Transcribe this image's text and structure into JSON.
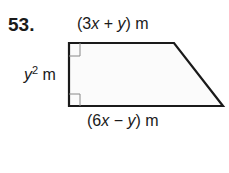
{
  "problem_number": "53.",
  "labels": {
    "top": {
      "pre": "(3",
      "v1": "x",
      "mid": " + ",
      "v2": "y",
      "post": ") m"
    },
    "bottom": {
      "pre": "(6",
      "v1": "x",
      "mid": " − ",
      "v2": "y",
      "post": ") m"
    },
    "side": {
      "var": "y",
      "exp": "2",
      "unit": " m"
    }
  },
  "shape": {
    "type": "right trapezoid",
    "stroke_color": "#1a1a1a",
    "fill_color": "#fbfbfb",
    "right_angle_markers": 2
  }
}
